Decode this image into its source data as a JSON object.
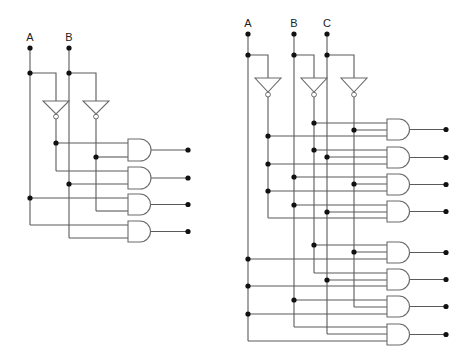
{
  "diagrams": [
    {
      "name": "decoder-2-to-4",
      "inputs": [
        {
          "label": "A",
          "x": 30,
          "label_y": 41,
          "top_dot_y": 48,
          "branch_y": 73,
          "bottom_y": 225
        },
        {
          "label": "B",
          "x": 69,
          "label_y": 41,
          "top_dot_y": 48,
          "branch_y": 73,
          "bottom_y": 238
        }
      ],
      "inverters": [
        {
          "of": "A",
          "cx": 56,
          "top_y": 101,
          "half_w": 13,
          "tip_y": 114,
          "out_bottom_y": 171
        },
        {
          "of": "B",
          "cx": 96,
          "top_y": 101,
          "half_w": 13,
          "tip_y": 114,
          "out_bottom_y": 211
        }
      ],
      "gates": [
        {
          "x": 128,
          "y": 139,
          "h": 22,
          "inputs": [
            {
              "y": 143,
              "from_x": 56,
              "dot": true
            },
            {
              "y": 157,
              "from_x": 96,
              "dot": true
            }
          ],
          "out_x": 188
        },
        {
          "x": 128,
          "y": 167,
          "h": 22,
          "inputs": [
            {
              "y": 171,
              "from_x": 56,
              "dot": false
            },
            {
              "y": 184,
              "from_x": 69,
              "dot": true
            }
          ],
          "out_x": 188
        },
        {
          "x": 128,
          "y": 194,
          "h": 21,
          "inputs": [
            {
              "y": 198,
              "from_x": 30,
              "dot": true
            },
            {
              "y": 211,
              "from_x": 96,
              "dot": false
            }
          ],
          "out_x": 188
        },
        {
          "x": 128,
          "y": 221,
          "h": 21,
          "inputs": [
            {
              "y": 225,
              "from_x": 30,
              "dot": false
            },
            {
              "y": 238,
              "from_x": 69,
              "dot": false
            }
          ],
          "out_x": 188
        }
      ],
      "outputs": [
        "A'B'",
        "A'B",
        "AB'",
        "AB"
      ]
    },
    {
      "name": "decoder-3-to-8",
      "inputs": [
        {
          "label": "A",
          "x": 248,
          "label_y": 27,
          "top_dot_y": 34,
          "branch_y": 55,
          "bottom_y": 341
        },
        {
          "label": "B",
          "x": 294,
          "label_y": 27,
          "top_dot_y": 34,
          "branch_y": 55,
          "bottom_y": 327
        },
        {
          "label": "C",
          "x": 327,
          "label_y": 27,
          "top_dot_y": 34,
          "branch_y": 55,
          "bottom_y": 334
        }
      ],
      "inverters": [
        {
          "of": "A",
          "cx": 268,
          "top_y": 78,
          "half_w": 13,
          "tip_y": 92,
          "out_bottom_y": 218
        },
        {
          "of": "B",
          "cx": 314,
          "top_y": 78,
          "half_w": 13,
          "tip_y": 92,
          "out_bottom_y": 273
        },
        {
          "of": "C",
          "cx": 354,
          "top_y": 78,
          "half_w": 13,
          "tip_y": 92,
          "out_bottom_y": 307
        }
      ],
      "gates": [
        {
          "x": 387,
          "y": 119,
          "h": 21,
          "inputs": [
            {
              "y": 123,
              "from_x": 314,
              "dot": true
            },
            {
              "y": 130,
              "from_x": 354,
              "dot": true
            },
            {
              "y": 136,
              "from_x": 268,
              "dot": true
            }
          ],
          "out_x": 446
        },
        {
          "x": 387,
          "y": 147,
          "h": 21,
          "inputs": [
            {
              "y": 150,
              "from_x": 314,
              "dot": true
            },
            {
              "y": 157,
              "from_x": 327,
              "dot": true
            },
            {
              "y": 164,
              "from_x": 268,
              "dot": true
            }
          ],
          "out_x": 446
        },
        {
          "x": 387,
          "y": 174,
          "h": 21,
          "inputs": [
            {
              "y": 177,
              "from_x": 294,
              "dot": true
            },
            {
              "y": 184,
              "from_x": 354,
              "dot": true
            },
            {
              "y": 191,
              "from_x": 268,
              "dot": true
            }
          ],
          "out_x": 446
        },
        {
          "x": 387,
          "y": 201,
          "h": 21,
          "inputs": [
            {
              "y": 205,
              "from_x": 294,
              "dot": true
            },
            {
              "y": 212,
              "from_x": 327,
              "dot": true
            },
            {
              "y": 218,
              "from_x": 268,
              "dot": false
            }
          ],
          "out_x": 446
        },
        {
          "x": 387,
          "y": 242,
          "h": 21,
          "inputs": [
            {
              "y": 245,
              "from_x": 314,
              "dot": true
            },
            {
              "y": 252,
              "from_x": 354,
              "dot": true
            },
            {
              "y": 259,
              "from_x": 248,
              "dot": true
            }
          ],
          "out_x": 446
        },
        {
          "x": 387,
          "y": 269,
          "h": 21,
          "inputs": [
            {
              "y": 273,
              "from_x": 314,
              "dot": false
            },
            {
              "y": 280,
              "from_x": 327,
              "dot": true
            },
            {
              "y": 286,
              "from_x": 248,
              "dot": true
            }
          ],
          "out_x": 446
        },
        {
          "x": 387,
          "y": 296,
          "h": 21,
          "inputs": [
            {
              "y": 300,
              "from_x": 294,
              "dot": true
            },
            {
              "y": 307,
              "from_x": 354,
              "dot": false
            },
            {
              "y": 314,
              "from_x": 248,
              "dot": true
            }
          ],
          "out_x": 446
        },
        {
          "x": 387,
          "y": 324,
          "h": 21,
          "inputs": [
            {
              "y": 327,
              "from_x": 294,
              "dot": false
            },
            {
              "y": 334,
              "from_x": 327,
              "dot": false
            },
            {
              "y": 341,
              "from_x": 248,
              "dot": false
            }
          ],
          "out_x": 446
        }
      ],
      "outputs": [
        "A'B'C'",
        "A'B'C",
        "A'BC'",
        "A'BC",
        "AB'C'",
        "AB'C",
        "ABC'",
        "ABC"
      ]
    }
  ],
  "colors": {
    "wire": "#5a5a5a",
    "gate_outline": "#6a6a6a",
    "junction_dot": "#111111",
    "label": "#222222",
    "background": "#ffffff"
  }
}
